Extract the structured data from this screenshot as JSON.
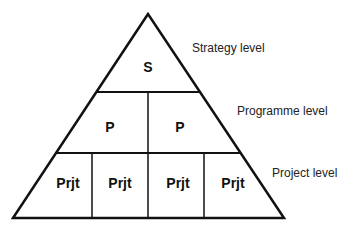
{
  "diagram": {
    "type": "hierarchy-pyramid",
    "levels": [
      {
        "name": "Strategy level",
        "cells": [
          "S"
        ]
      },
      {
        "name": "Programme level",
        "cells": [
          "P",
          "P"
        ]
      },
      {
        "name": "Project level",
        "cells": [
          "Prjt",
          "Prjt",
          "Prjt",
          "Prjt"
        ]
      }
    ],
    "colors": {
      "line": "#111111",
      "background": "#ffffff"
    }
  }
}
